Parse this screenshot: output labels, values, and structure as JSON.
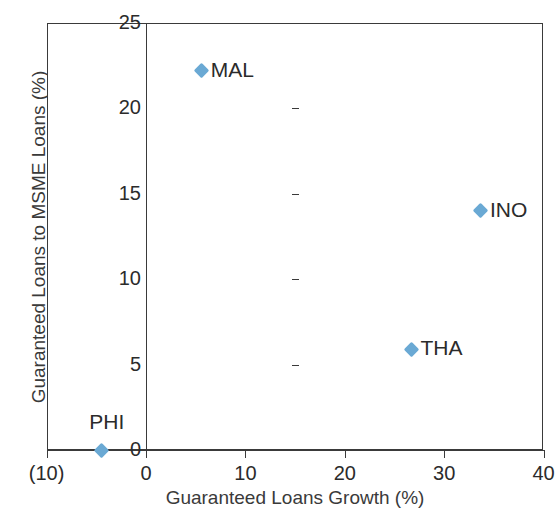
{
  "chart_data": {
    "type": "scatter",
    "title": "",
    "xlabel": "Guaranteed Loans Growth (%)",
    "ylabel": "Guaranteed Loans to MSME Loans (%)",
    "xlim": [
      -10,
      40
    ],
    "ylim": [
      0,
      25
    ],
    "grid": false,
    "legend": "none",
    "marker_color": "#6aa9d4",
    "marker_shape": "diamond",
    "xticks": [
      -10,
      0,
      10,
      20,
      30,
      40
    ],
    "xtick_labels": [
      "(10)",
      "0",
      "10",
      "20",
      "30",
      "40"
    ],
    "yticks": [
      0,
      5,
      10,
      15,
      20,
      25
    ],
    "ytick_labels": [
      "0",
      "5",
      "10",
      "15",
      "20",
      "25"
    ],
    "points": [
      {
        "label": "MAL",
        "x": 5.6,
        "y": 22.2,
        "label_pos": "right"
      },
      {
        "label": "INO",
        "x": 33.7,
        "y": 14.0,
        "label_pos": "right"
      },
      {
        "label": "THA",
        "x": 26.7,
        "y": 5.9,
        "label_pos": "right"
      },
      {
        "label": "PHI",
        "x": -4.5,
        "y": 0.0,
        "label_pos": "above"
      }
    ]
  }
}
